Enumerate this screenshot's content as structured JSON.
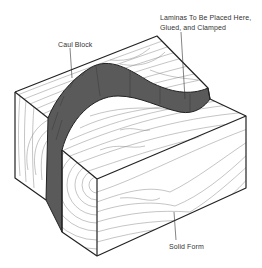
{
  "figure": {
    "labels": {
      "caul_block": "Caul Block",
      "laminas_line1": "Laminas To Be Placed Here,",
      "laminas_line2": "Glued, and Clamped",
      "solid_form": "Solid Form"
    },
    "colors": {
      "outline": "#222222",
      "grain": "#8a8a8a",
      "lamina_fill": "#5a5a5a",
      "background": "#ffffff"
    }
  }
}
